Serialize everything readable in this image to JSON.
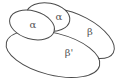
{
  "diagram": {
    "type": "overlapping-regions",
    "regions": [
      {
        "id": "beta",
        "label": "β"
      },
      {
        "id": "beta-prime",
        "label": "β'"
      },
      {
        "id": "alpha-back",
        "label": "α"
      },
      {
        "id": "alpha-front",
        "label": "α"
      }
    ],
    "colors": {
      "stroke": "#4a4a4a",
      "label": "#555555",
      "fill": "#ffffff"
    }
  }
}
